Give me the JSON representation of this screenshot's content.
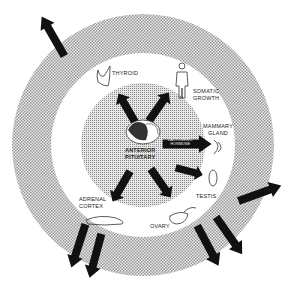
{
  "diagram": {
    "center_label": [
      "ANTERIOR",
      "PITUITARY"
    ],
    "targets": [
      {
        "id": "thyroid",
        "label": [
          "THYROID"
        ]
      },
      {
        "id": "somatic-growth",
        "label": [
          "SOMATIC",
          "GROWTH"
        ]
      },
      {
        "id": "mammary-gland",
        "label": [
          "MAMMARY",
          "GLAND"
        ]
      },
      {
        "id": "testis",
        "label": [
          "TESTIS"
        ]
      },
      {
        "id": "ovary",
        "label": [
          "OVARY"
        ]
      },
      {
        "id": "adrenal-cortex",
        "label": [
          "ADRENAL",
          "CORTEX"
        ]
      }
    ],
    "inner_arrows": [
      {
        "id": "to-thyroid"
      },
      {
        "id": "to-somatic"
      },
      {
        "id": "lactogenic",
        "label": [
          "LACTOGENIC",
          "HORMONE"
        ]
      },
      {
        "id": "to-gonads"
      },
      {
        "id": "to-adrenal"
      }
    ],
    "outer_arrows": [
      {
        "id": "from-thyroid"
      },
      {
        "id": "from-testis"
      },
      {
        "id": "from-ovary-1"
      },
      {
        "id": "from-ovary-2"
      },
      {
        "id": "from-adrenal-1"
      },
      {
        "id": "from-adrenal-2"
      }
    ],
    "colors": {
      "stipple": "#b9b9b9",
      "arrow": "#111111",
      "background": "#ffffff"
    }
  }
}
